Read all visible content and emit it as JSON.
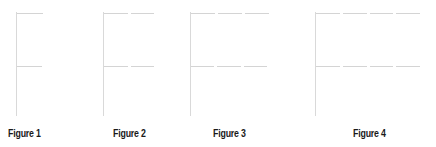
{
  "figures": [
    {
      "label": "Figure 1",
      "segments": 1
    },
    {
      "label": "Figure 2",
      "segments": 2
    },
    {
      "label": "Figure 3",
      "segments": 3
    },
    {
      "label": "Figure 4",
      "segments": 4
    }
  ],
  "colors": {
    "line": "#d9d9d9",
    "label": "#1a1a1a",
    "background": "#ffffff"
  }
}
